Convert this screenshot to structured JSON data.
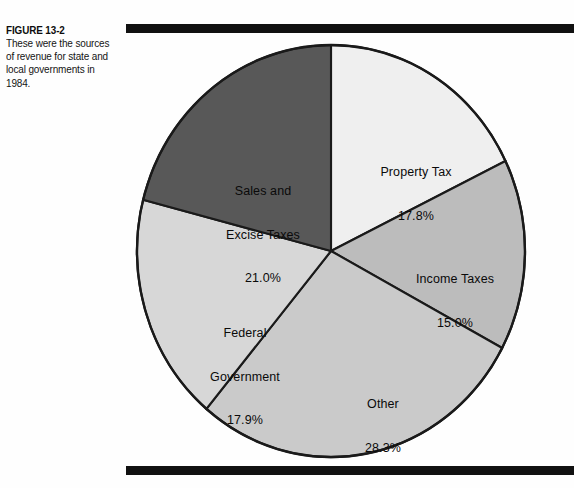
{
  "figure": {
    "number": "FIGURE 13-2",
    "caption": "These were the sources of revenue for state and local governments in 1984."
  },
  "rules": {
    "top_label": "top-rule",
    "bottom_label": "bottom-rule",
    "color": "#111111"
  },
  "chart_data": {
    "type": "pie",
    "title": "Sources of revenue for state and local governments in 1984",
    "categories": [
      "Property Tax",
      "Income Taxes",
      "Other",
      "Federal Government",
      "Sales and Excise Taxes"
    ],
    "values": [
      17.8,
      15.0,
      28.3,
      17.9,
      21.0
    ],
    "value_labels": [
      "17.8%",
      "15.0%",
      "28.3%",
      "17.9%",
      "21.0%"
    ],
    "units": "percent",
    "total": 100.0,
    "start_angle_deg": 0,
    "direction": "clockwise",
    "legend": "none",
    "labels_inside": true,
    "slice_colors": [
      "#efefef",
      "#bcbcbc",
      "#cacaca",
      "#d7d7d7",
      "#585858"
    ],
    "slice_outline_color": "#1a1a1a",
    "slices": [
      {
        "label": "Property Tax",
        "value": 17.8,
        "display": "17.8%",
        "color": "#efefef"
      },
      {
        "label": "Income Taxes",
        "value": 15.0,
        "display": "15.0%",
        "color": "#bcbcbc"
      },
      {
        "label": "Other",
        "value": 28.3,
        "display": "28.3%",
        "color": "#cacaca"
      },
      {
        "label": "Federal Government",
        "value": 17.9,
        "display": "17.9%",
        "color": "#d7d7d7"
      },
      {
        "label": "Sales and Excise Taxes",
        "value": 21.0,
        "display": "21.0%",
        "color": "#585858"
      }
    ]
  },
  "labels": {
    "property_tax": {
      "name": "Property Tax",
      "value": "17.8%"
    },
    "income_taxes": {
      "name": "Income Taxes",
      "value": "15.0%"
    },
    "other": {
      "name": "Other",
      "value": "28.3%"
    },
    "federal_government": {
      "name_line1": "Federal",
      "name_line2": "Government",
      "value": "17.9%"
    },
    "sales_excise_taxes": {
      "name_line1": "Sales and",
      "name_line2": "Excise Taxes",
      "value": "21.0%"
    }
  }
}
